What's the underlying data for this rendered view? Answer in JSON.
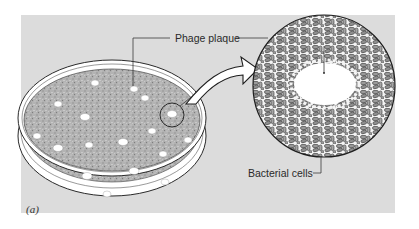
{
  "figure": {
    "panel_label": "(a)",
    "background_color": "#dcdcdc",
    "agar_color": "#a9a9a9",
    "labels": {
      "phage_plaque": "Phage plaque",
      "bacterial_cells": "Bacterial cells"
    },
    "petri_dish": {
      "plaque_count": 17,
      "highlighted_plaque": "circled plaque magnified at right"
    },
    "magnified_view": {
      "content": "bacterial lawn with central cleared plaque zone"
    }
  }
}
